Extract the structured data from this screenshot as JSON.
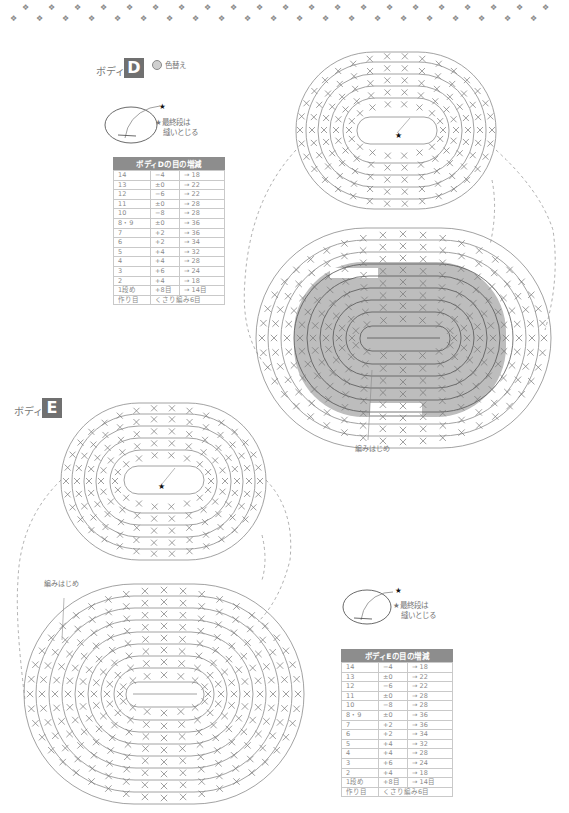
{
  "decoration": {
    "pattern": "paw-print-border",
    "paw_glyph": "🐾"
  },
  "body_d": {
    "label": "ボディ",
    "badge": "D",
    "legend_label": "色替え",
    "legend_color": "#cfcfcf",
    "note_star": "★",
    "note_line1": "★最終段は",
    "note_line2": "縫いとじる",
    "start_label": "編みはじめ",
    "table": {
      "title": "ボディDの目の増減",
      "rows": [
        [
          "14",
          "−4",
          "→ 18"
        ],
        [
          "13",
          "±0",
          "→ 22"
        ],
        [
          "12",
          "−6",
          "→ 22"
        ],
        [
          "11",
          "±0",
          "→ 28"
        ],
        [
          "10",
          "−8",
          "→ 28"
        ],
        [
          "8・9",
          "±0",
          "→ 36"
        ],
        [
          "7",
          "+2",
          "→ 36"
        ],
        [
          "6",
          "+2",
          "→ 34"
        ],
        [
          "5",
          "+4",
          "→ 32"
        ],
        [
          "4",
          "+4",
          "→ 28"
        ],
        [
          "3",
          "+6",
          "→ 24"
        ],
        [
          "2",
          "+4",
          "→ 18"
        ],
        [
          "1段め",
          "+8目",
          "→ 14目"
        ],
        [
          "作り目",
          "くさり編み6目",
          ""
        ]
      ]
    },
    "top_round_labels": [
      "⑩",
      "⑪",
      "⑫",
      "⑬",
      "⑭"
    ],
    "bottom_round_labels": [
      "①",
      "②",
      "③",
      "④",
      "⑤",
      "⑥",
      "⑦",
      "⑧",
      "⑨"
    ],
    "shade_color": "#bdbdbd"
  },
  "body_e": {
    "label": "ボディ",
    "badge": "E",
    "note_star": "★",
    "note_line1": "★最終段は",
    "note_line2": "縫いとじる",
    "start_label": "編みはじめ",
    "table": {
      "title": "ボディEの目の増減",
      "rows": [
        [
          "14",
          "−4",
          "→ 18"
        ],
        [
          "13",
          "±0",
          "→ 22"
        ],
        [
          "12",
          "−6",
          "→ 22"
        ],
        [
          "11",
          "±0",
          "→ 28"
        ],
        [
          "10",
          "−8",
          "→ 28"
        ],
        [
          "8・9",
          "±0",
          "→ 36"
        ],
        [
          "7",
          "+2",
          "→ 36"
        ],
        [
          "6",
          "+2",
          "→ 34"
        ],
        [
          "5",
          "+4",
          "→ 32"
        ],
        [
          "4",
          "+4",
          "→ 28"
        ],
        [
          "3",
          "+6",
          "→ 24"
        ],
        [
          "2",
          "+4",
          "→ 18"
        ],
        [
          "1段め",
          "+8目",
          "→ 14目"
        ],
        [
          "作り目",
          "くさり編み6目",
          ""
        ]
      ]
    },
    "top_round_labels": [
      "⑩",
      "⑪",
      "⑫",
      "⑬",
      "⑭"
    ],
    "bottom_round_labels": [
      "①",
      "②",
      "③",
      "④",
      "⑤",
      "⑥",
      "⑦",
      "⑧",
      "⑨"
    ]
  }
}
